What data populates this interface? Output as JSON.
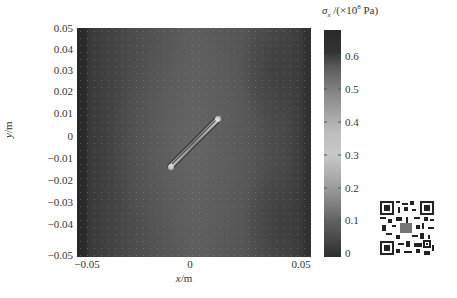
{
  "chart_data": {
    "type": "heatmap",
    "title": "",
    "xlabel": "x/m",
    "ylabel": "y/m",
    "xlim": [
      -0.05,
      0.05
    ],
    "ylim": [
      -0.05,
      0.05
    ],
    "x_ticks": [
      "-0.05",
      "0",
      "0.05"
    ],
    "y_ticks": [
      "0.05",
      "0.04",
      "0.03",
      "0.02",
      "0.01",
      "0",
      "-0.01",
      "-0.02",
      "-0.03",
      "-0.04",
      "-0.05"
    ],
    "colorbar": {
      "label": "σx /(×10^8 Pa)",
      "range": [
        0,
        0.7
      ],
      "ticks": [
        "0.6",
        "0.5",
        "0.4",
        "0.3",
        "0.2",
        "0.1",
        "0"
      ],
      "colormap": "grayscale (dark at 0 and 0.7, light mid-range)"
    },
    "features": {
      "crack": {
        "from": [
          -0.008,
          -0.012
        ],
        "to": [
          0.012,
          0.01
        ],
        "description": "inclined crack at ~45°, with stress concentration at tips"
      },
      "field_description": "stress σx varies across the plate; darker bands near left and right edges, lighter regions centered"
    },
    "grid": false
  },
  "axes": {
    "ylabel_var": "y",
    "ylabel_unit": "/m",
    "xlabel_var": "x",
    "xlabel_unit": "/m",
    "y_ticks": [
      {
        "label": "0.05",
        "top": 23
      },
      {
        "label": "0.04",
        "top": 44
      },
      {
        "label": "0.03",
        "top": 65
      },
      {
        "label": "0.02",
        "top": 86
      },
      {
        "label": "0.01",
        "top": 108
      },
      {
        "label": "0",
        "top": 131
      },
      {
        "label": "-0.01",
        "top": 153
      },
      {
        "label": "-0.02",
        "top": 175
      },
      {
        "label": "-0.03",
        "top": 197
      },
      {
        "label": "-0.04",
        "top": 219
      },
      {
        "label": "-0.05",
        "top": 250
      }
    ],
    "x_ticks": [
      {
        "label": "-0.05",
        "left": 87
      },
      {
        "label": "0",
        "left": 190
      },
      {
        "label": "0.05",
        "left": 301
      }
    ]
  },
  "colorbar": {
    "title_sym": "σ",
    "title_sub": "x",
    "title_rest": " /(×10",
    "title_exp": "8",
    "title_tail": " Pa)",
    "ticks": [
      {
        "label": "0.6",
        "top": 56
      },
      {
        "label": "0.5",
        "top": 89
      },
      {
        "label": "0.4",
        "top": 122
      },
      {
        "label": "0.3",
        "top": 155
      },
      {
        "label": "0.2",
        "top": 188
      },
      {
        "label": "0.1",
        "top": 220
      },
      {
        "label": "0",
        "top": 253
      }
    ]
  },
  "qr_code": {
    "present": true
  }
}
